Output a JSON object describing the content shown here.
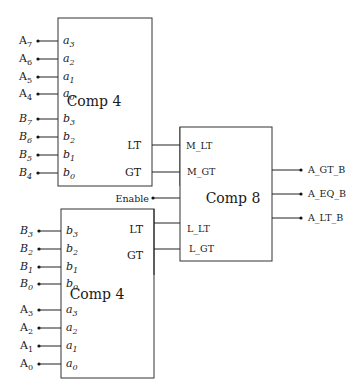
{
  "diagram": {
    "top_comparator": {
      "title": "Comp 4",
      "inputs": [
        {
          "ext": "A",
          "ext_sub": "7",
          "port": "a",
          "port_sub": "3"
        },
        {
          "ext": "A",
          "ext_sub": "6",
          "port": "a",
          "port_sub": "2"
        },
        {
          "ext": "A",
          "ext_sub": "5",
          "port": "a",
          "port_sub": "1"
        },
        {
          "ext": "A",
          "ext_sub": "4",
          "port": "a",
          "port_sub": "0"
        },
        {
          "ext": "B",
          "ext_sub": "7",
          "port": "b",
          "port_sub": "3"
        },
        {
          "ext": "B",
          "ext_sub": "6",
          "port": "b",
          "port_sub": "2"
        },
        {
          "ext": "B",
          "ext_sub": "5",
          "port": "b",
          "port_sub": "1"
        },
        {
          "ext": "B",
          "ext_sub": "4",
          "port": "b",
          "port_sub": "0"
        }
      ],
      "outputs": [
        "LT",
        "GT"
      ]
    },
    "bottom_comparator": {
      "title": "Comp 4",
      "inputs": [
        {
          "ext": "B",
          "ext_sub": "3",
          "port": "b",
          "port_sub": "3"
        },
        {
          "ext": "B",
          "ext_sub": "2",
          "port": "b",
          "port_sub": "2"
        },
        {
          "ext": "B",
          "ext_sub": "1",
          "port": "b",
          "port_sub": "1"
        },
        {
          "ext": "B",
          "ext_sub": "0",
          "port": "b",
          "port_sub": "0"
        },
        {
          "ext": "A",
          "ext_sub": "3",
          "port": "a",
          "port_sub": "3"
        },
        {
          "ext": "A",
          "ext_sub": "2",
          "port": "a",
          "port_sub": "2"
        },
        {
          "ext": "A",
          "ext_sub": "1",
          "port": "a",
          "port_sub": "1"
        },
        {
          "ext": "A",
          "ext_sub": "0",
          "port": "a",
          "port_sub": "0"
        }
      ],
      "outputs": [
        "LT",
        "GT"
      ]
    },
    "main_comparator": {
      "title": "Comp 8",
      "inputs": [
        "M_LT",
        "M_GT",
        "L_LT",
        "L_GT"
      ],
      "enable_label": "Enable",
      "outputs": [
        "A_GT_B",
        "A_EQ_B",
        "A_LT_B"
      ]
    }
  }
}
